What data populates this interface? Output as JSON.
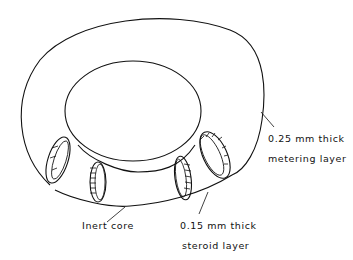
{
  "diagram": {
    "type": "cutaway drawing of a ring-shaped device",
    "labels": {
      "metering_line1": "0.25 mm thick",
      "metering_line2": "metering layer",
      "core": "Inert core",
      "steroid_line1": "0.15 mm thick",
      "steroid_line2": "steroid layer"
    },
    "colors": {
      "ink": "#111111",
      "background": "#ffffff"
    }
  }
}
